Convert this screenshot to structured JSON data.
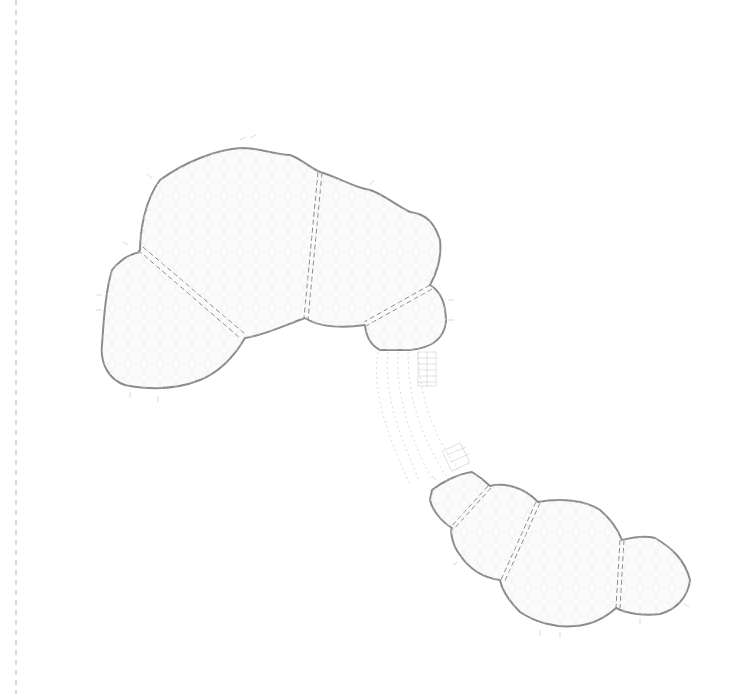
{
  "diagram": {
    "type": "architectural-plan",
    "colors": {
      "background": "#ffffff",
      "outline": "#8c8c8c",
      "seam": "#8a8a8a",
      "guide_line": "#b5b5b5",
      "fill": "#fbfbfb"
    },
    "left_guide_line": {
      "x": 16,
      "style": "dashed"
    },
    "clusters": [
      {
        "name": "upper-cluster",
        "volumes": [
          "upper-left-lobe",
          "upper-center-lobe",
          "upper-right-lobe",
          "upper-small-lobe"
        ],
        "seam_count": 3
      },
      {
        "name": "lower-cluster",
        "volumes": [
          "lower-small-lobe",
          "lower-second-lobe",
          "lower-center-lobe",
          "lower-right-lobe"
        ],
        "seam_count": 3
      }
    ],
    "connector": {
      "name": "curved-corridor",
      "from": "upper-small-lobe",
      "to": "lower-small-lobe"
    },
    "labels": []
  }
}
